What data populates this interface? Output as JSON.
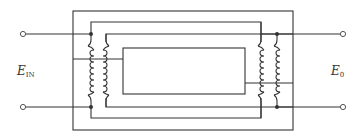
{
  "diagram": {
    "type": "transformer-core-schematic",
    "labels": {
      "input_voltage": {
        "main": "E",
        "sub": "IN"
      },
      "output_voltage": {
        "main": "E",
        "sub": "0"
      }
    },
    "colors": {
      "line": "#333333",
      "background": "#ffffff"
    },
    "components": [
      "input-terminal-top",
      "input-terminal-bottom",
      "primary-coil",
      "secondary-coil",
      "output-terminal-top",
      "output-terminal-bottom",
      "laminated-core-frames"
    ]
  }
}
